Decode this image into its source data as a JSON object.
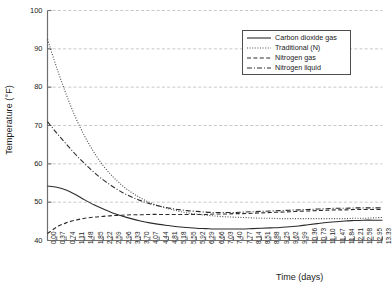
{
  "chart_data": {
    "type": "line",
    "title": "",
    "xlabel": "Time (days)",
    "ylabel": "Temperature (°F)",
    "xlim": [
      0.0,
      13.33
    ],
    "ylim": [
      40,
      100
    ],
    "yticks": [
      40,
      50,
      60,
      70,
      80,
      90,
      100
    ],
    "grid": "horizontal-dashed",
    "legend_position": "top-right-inside",
    "xticks": [
      "0.00",
      "0.37",
      "0.74",
      "1.11",
      "1.48",
      "1.85",
      "2.22",
      "2.59",
      "2.96",
      "3.33",
      "3.70",
      "4.07",
      "4.44",
      "4.81",
      "5.18",
      "5.55",
      "5.92",
      "6.29",
      "6.66",
      "7.03",
      "7.40",
      "7.77",
      "8.14",
      "8.51",
      "8.88",
      "9.25",
      "9.62",
      "9.99",
      "10.36",
      "10.73",
      "11.10",
      "11.47",
      "11.84",
      "12.21",
      "12.58",
      "12.95",
      "13.33"
    ],
    "x": [
      0.0,
      0.37,
      0.74,
      1.11,
      1.48,
      1.85,
      2.22,
      2.59,
      2.96,
      3.33,
      3.7,
      4.07,
      4.44,
      4.81,
      5.18,
      5.55,
      5.92,
      6.29,
      6.66,
      7.03,
      7.4,
      7.77,
      8.14,
      8.51,
      8.88,
      9.25,
      9.62,
      9.99,
      10.36,
      10.73,
      11.1,
      11.47,
      11.84,
      12.21,
      12.58,
      12.95,
      13.33
    ],
    "series": [
      {
        "name": "Carbon dioxide gas",
        "style": "solid",
        "color": "#2b2b2b",
        "values": [
          54.2,
          53.9,
          53.2,
          52.0,
          50.6,
          49.3,
          48.2,
          47.2,
          46.4,
          45.7,
          45.1,
          44.6,
          44.2,
          43.9,
          43.6,
          43.4,
          43.2,
          43.1,
          43.0,
          43.0,
          43.0,
          43.0,
          43.1,
          43.2,
          43.3,
          43.4,
          43.6,
          43.8,
          44.1,
          44.4,
          44.7,
          44.9,
          45.1,
          45.2,
          45.3,
          45.3,
          45.3
        ]
      },
      {
        "name": "Traditional (N)",
        "style": "dotted",
        "color": "#4d4d4d",
        "values": [
          92.5,
          85.0,
          78.2,
          72.2,
          67.2,
          63.0,
          59.5,
          56.7,
          54.4,
          52.6,
          51.1,
          49.9,
          49.0,
          48.3,
          47.7,
          47.2,
          46.9,
          46.6,
          46.4,
          46.2,
          46.1,
          46.0,
          45.9,
          45.8,
          45.8,
          45.7,
          45.7,
          45.7,
          45.7,
          45.7,
          45.7,
          45.7,
          45.7,
          45.8,
          45.8,
          45.9,
          46.0
        ]
      },
      {
        "name": "Nitrogen gas",
        "style": "dashed",
        "color": "#2b2b2b",
        "values": [
          41.8,
          43.5,
          44.6,
          45.3,
          45.8,
          46.1,
          46.3,
          46.5,
          46.6,
          46.7,
          46.7,
          46.8,
          46.8,
          46.8,
          46.8,
          46.8,
          46.8,
          46.8,
          46.9,
          46.9,
          47.0,
          47.0,
          47.1,
          47.2,
          47.3,
          47.4,
          47.5,
          47.6,
          47.7,
          47.8,
          47.9,
          48.0,
          48.0,
          48.1,
          48.1,
          48.1,
          48.1
        ]
      },
      {
        "name": "Nitrogen liquid",
        "style": "dashdot",
        "color": "#2b2b2b",
        "values": [
          71.0,
          68.0,
          65.2,
          62.5,
          60.0,
          57.8,
          55.8,
          54.1,
          52.6,
          51.4,
          50.4,
          49.6,
          49.0,
          48.5,
          48.1,
          47.8,
          47.6,
          47.4,
          47.3,
          47.3,
          47.3,
          47.4,
          47.5,
          47.6,
          47.7,
          47.8,
          47.9,
          48.0,
          48.1,
          48.2,
          48.3,
          48.4,
          48.4,
          48.5,
          48.5,
          48.5,
          48.5
        ]
      }
    ]
  },
  "legend": {
    "items": [
      {
        "label": "Carbon dioxide gas"
      },
      {
        "label": "Traditional (N)"
      },
      {
        "label": "Nitrogen gas"
      },
      {
        "label": "Nitrogen liquid"
      }
    ]
  },
  "axes": {
    "frame_color": "#6e6e6e",
    "grid_color": "#c8c8c8",
    "tick_color": "#6e6e6e",
    "text_color": "#1a1a1a"
  }
}
